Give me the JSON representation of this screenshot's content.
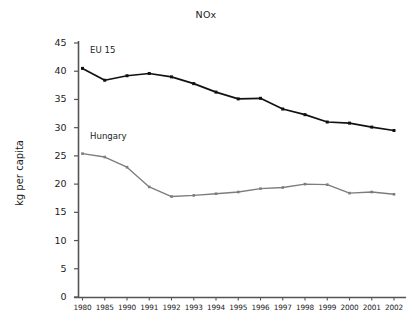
{
  "chart_data": {
    "type": "line",
    "title": "NOx",
    "xlabel": "",
    "ylabel": "kg per capita",
    "ylim": [
      0,
      45
    ],
    "yticks": [
      0,
      5,
      10,
      15,
      20,
      25,
      30,
      35,
      40,
      45
    ],
    "grid": false,
    "legend_position": "inline-annotation",
    "categories": [
      "1980",
      "1985",
      "1990",
      "1991",
      "1992",
      "1993",
      "1994",
      "1995",
      "1996",
      "1997",
      "1998",
      "1999",
      "2000",
      "2001",
      "2002"
    ],
    "series": [
      {
        "name": "EU 15",
        "color": "#111111",
        "marker": "square",
        "label_x": "1980",
        "values": [
          40.5,
          38.4,
          39.2,
          39.6,
          39.0,
          37.8,
          36.3,
          35.1,
          35.2,
          33.3,
          32.3,
          31.0,
          30.8,
          30.1,
          29.5
        ]
      },
      {
        "name": "Hungary",
        "color": "#7d7d7d",
        "marker": "square",
        "label_x": "1980",
        "values": [
          25.4,
          24.8,
          23.0,
          19.5,
          17.8,
          18.0,
          18.3,
          18.6,
          19.2,
          19.4,
          20.0,
          19.9,
          18.4,
          18.6,
          18.2
        ]
      }
    ]
  },
  "axes": {
    "y_axis_title": "kg per capita",
    "y_tick_labels": [
      "45",
      "40",
      "35",
      "30",
      "25",
      "20",
      "15",
      "10",
      "5",
      "0"
    ],
    "x_tick_labels": [
      "1980",
      "1985",
      "1990",
      "1991",
      "1992",
      "1993",
      "1994",
      "1995",
      "1996",
      "1997",
      "1998",
      "1999",
      "2000",
      "2001",
      "2002"
    ]
  },
  "annotations": {
    "eu15_label": "EU 15",
    "hungary_label": "Hungary"
  },
  "colors": {
    "eu15": "#111111",
    "hungary": "#7d7d7d",
    "axis": "#555555",
    "text": "#1d1d1d",
    "background": "#ffffff"
  }
}
